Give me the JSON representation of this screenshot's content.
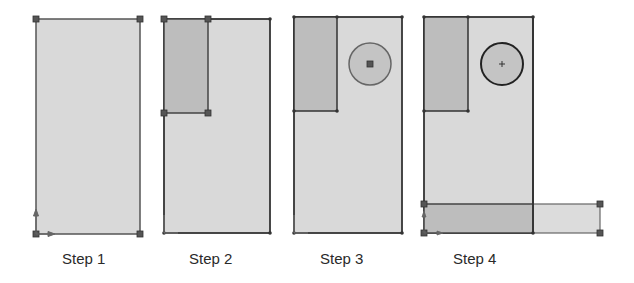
{
  "steps": [
    {
      "label": "Step 1"
    },
    {
      "label": "Step 2"
    },
    {
      "label": "Step 3"
    },
    {
      "label": "Step 4"
    }
  ],
  "colors": {
    "background": "#ffffff",
    "body_fill": "#d9d9d9",
    "cut_fill": "#bdbdbd",
    "edge": "#333333",
    "handle": "#555555",
    "bar_light_fill": "#dcdcdc"
  }
}
